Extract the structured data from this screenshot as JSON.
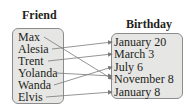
{
  "domain_titles": {
    "domain": "Friend",
    "range": "Birthday"
  },
  "friends": [
    {
      "name": "Max"
    },
    {
      "name": "Alesia"
    },
    {
      "name": "Trent"
    },
    {
      "name": "Yolanda"
    },
    {
      "name": "Wanda"
    },
    {
      "name": "Elvis"
    }
  ],
  "birthdays": [
    {
      "date": "January 20"
    },
    {
      "date": "March 3"
    },
    {
      "date": "July 6"
    },
    {
      "date": "November 8"
    },
    {
      "date": "January 8"
    }
  ],
  "mapping": [
    {
      "from": "Max",
      "to": "November 8"
    },
    {
      "from": "Alesia",
      "to": "January 20"
    },
    {
      "from": "Trent",
      "to": "March 3"
    },
    {
      "from": "Yolanda",
      "to": "November 8"
    },
    {
      "from": "Wanda",
      "to": "July 6"
    },
    {
      "from": "Elvis",
      "to": "January 8"
    }
  ],
  "colors": {
    "box_fill": "#e6e6e4",
    "box_border": "#8c8c8c",
    "arrow": "#7a7a7a"
  }
}
